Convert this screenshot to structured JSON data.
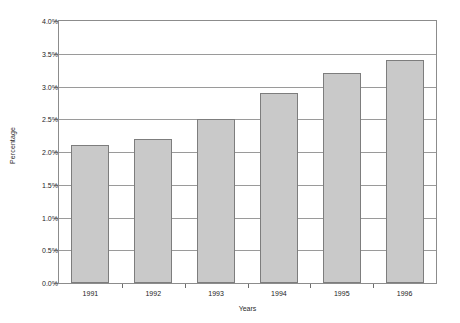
{
  "chart_data": {
    "type": "bar",
    "title": "",
    "xlabel": "Years",
    "ylabel": "Percentage",
    "categories": [
      "1991",
      "1992",
      "1993",
      "1994",
      "1995",
      "1996"
    ],
    "values": [
      2.1,
      2.2,
      2.5,
      2.9,
      3.2,
      3.4
    ],
    "ylim": [
      0.0,
      4.0
    ],
    "ytick_labels": [
      "0.0%",
      "0.5%",
      "1.0%",
      "1.5%",
      "2.0%",
      "2.5%",
      "3.0%",
      "3.5%",
      "4.0%"
    ],
    "ytick_values": [
      0.0,
      0.5,
      1.0,
      1.5,
      2.0,
      2.5,
      3.0,
      3.5,
      4.0
    ],
    "grid": true,
    "legend": "none",
    "series": [
      {
        "name": "Percentage",
        "values": [
          2.1,
          2.2,
          2.5,
          2.9,
          3.2,
          3.4
        ],
        "bar_fill_color": "#c9c9c9",
        "bar_border_color": "#7d7d7d"
      }
    ],
    "colors": {
      "bar_fill": "#c9c9c9",
      "bar_border": "#7d7d7d",
      "gridline": "#9a9a9a",
      "axis_frame": "#8c8c8c",
      "text": "#1d1d1d",
      "background": "#ffffff"
    }
  }
}
